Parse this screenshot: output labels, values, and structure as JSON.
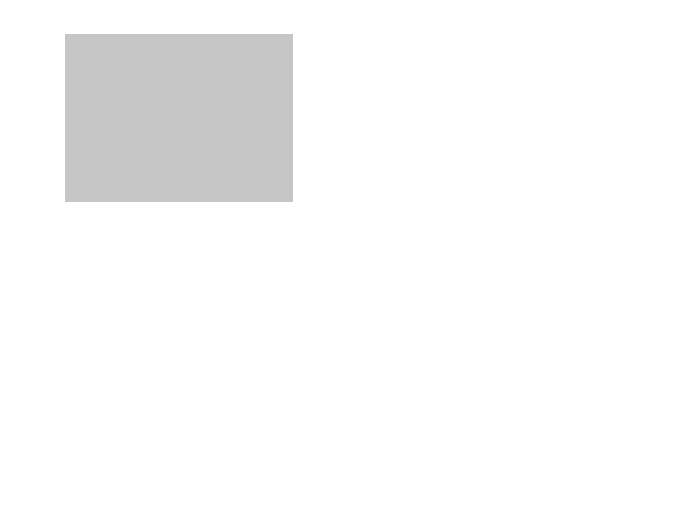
{
  "figure": {
    "panel_label": "(a)",
    "x_axis": {
      "title": "Longitude",
      "ticks": [
        "90°E",
        "120°E",
        "150°E",
        "180°",
        "150°W",
        "120°W",
        "90°W",
        "60°W",
        "30°W",
        "0°"
      ]
    },
    "y_axis": {
      "title": "Latitude",
      "ticks_left": [
        "60°N",
        "30°N",
        "0°",
        "30°S",
        "60°S"
      ],
      "ticks_right": [
        "60°N",
        "30°N",
        "0°",
        "30°S",
        "60°S"
      ]
    },
    "colors": {
      "ocean_plate": "#c8c8c8",
      "continental": "#e2e2e2",
      "nazca": "#f4f4f4",
      "small_plate": "#a8a8a8",
      "eurasian_dark": "#bcbcbc",
      "boundary": "#111111"
    },
    "plates": [
      {
        "id": "north-american-west",
        "line1": "(North)",
        "line2": "American",
        "line3": "plate"
      },
      {
        "id": "eurasian",
        "line1": "Eurasian",
        "line2": "plate"
      },
      {
        "id": "juan-de-fuca",
        "line1": "Juan de",
        "line2": "Fuca plate"
      },
      {
        "id": "san-andreas",
        "line1": "San Andreas",
        "line2": "fault"
      },
      {
        "id": "north-american-east",
        "line1": "(North)",
        "line2": "American",
        "line3": "plate"
      },
      {
        "id": "philippine",
        "line1": "Philippine",
        "line2": "plate"
      },
      {
        "id": "caroline",
        "line1": "Caroline",
        "line2": "plate"
      },
      {
        "id": "pacific",
        "line1": "Pacific",
        "line2": "plate"
      },
      {
        "id": "caribbean",
        "line1": "Caribbean",
        "line2": "plate"
      },
      {
        "id": "cocos",
        "line1": "Cocos",
        "line2": "plate"
      },
      {
        "id": "bismarck",
        "line1": "Bismarck",
        "line2": "plate"
      },
      {
        "id": "austral-indian",
        "line1": "Austral-Indian",
        "line2": "plate"
      },
      {
        "id": "nazca",
        "line1": "Nazca",
        "line2": "plate"
      },
      {
        "id": "south-american",
        "line1": "(South)",
        "line2": "American",
        "line3": "plate"
      },
      {
        "id": "scotia",
        "line1": "Scotia plate"
      },
      {
        "id": "antarctic",
        "line1": "Antarctic",
        "line2": "plate"
      }
    ],
    "question_mark": "?"
  }
}
